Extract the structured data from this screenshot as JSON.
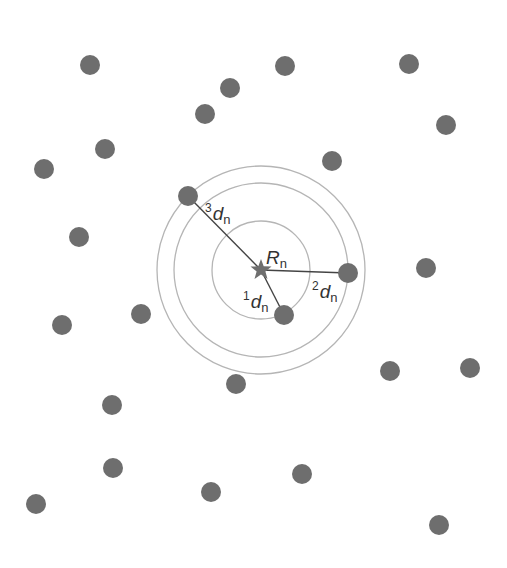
{
  "diagram": {
    "colors": {
      "background": "#ffffff",
      "dot": "#6e6e6e",
      "circle": "#b5b5b5",
      "line": "#444444",
      "star": "#6e6e6e",
      "text": "#333333"
    },
    "center": {
      "x": 261,
      "y": 270,
      "label_main": "R",
      "label_sub": "n"
    },
    "circles": [
      {
        "id": "first",
        "r": 49
      },
      {
        "id": "second",
        "r": 87
      },
      {
        "id": "third",
        "r": 104
      }
    ],
    "neighbors": [
      {
        "rank": "1",
        "x": 284,
        "y": 315,
        "label_sup": "1",
        "label_main": "d",
        "label_sub": "n",
        "lx": 243,
        "ly": 308
      },
      {
        "rank": "2",
        "x": 348,
        "y": 273,
        "label_sup": "2",
        "label_main": "d",
        "label_sub": "n",
        "lx": 312,
        "ly": 298
      },
      {
        "rank": "3",
        "x": 188,
        "y": 196,
        "label_sup": "3",
        "label_main": "d",
        "label_sub": "n",
        "lx": 205,
        "ly": 220
      }
    ],
    "points": [
      {
        "x": 90,
        "y": 65
      },
      {
        "x": 230,
        "y": 88
      },
      {
        "x": 285,
        "y": 66
      },
      {
        "x": 409,
        "y": 64
      },
      {
        "x": 205,
        "y": 114
      },
      {
        "x": 446,
        "y": 125
      },
      {
        "x": 105,
        "y": 149
      },
      {
        "x": 44,
        "y": 169
      },
      {
        "x": 332,
        "y": 161
      },
      {
        "x": 79,
        "y": 237
      },
      {
        "x": 426,
        "y": 268
      },
      {
        "x": 62,
        "y": 325
      },
      {
        "x": 141,
        "y": 314
      },
      {
        "x": 390,
        "y": 371
      },
      {
        "x": 470,
        "y": 368
      },
      {
        "x": 236,
        "y": 384
      },
      {
        "x": 112,
        "y": 405
      },
      {
        "x": 113,
        "y": 468
      },
      {
        "x": 302,
        "y": 474
      },
      {
        "x": 36,
        "y": 504
      },
      {
        "x": 211,
        "y": 492
      },
      {
        "x": 439,
        "y": 525
      }
    ],
    "dot_radius": 10
  }
}
